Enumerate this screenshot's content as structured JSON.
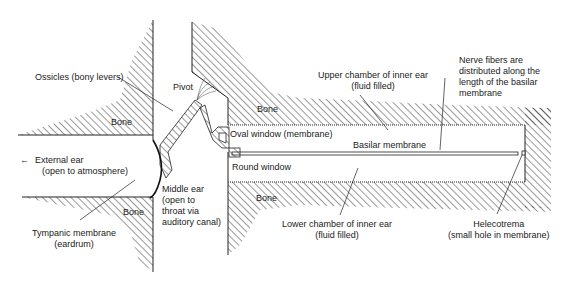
{
  "diagram": {
    "colors": {
      "line": "#222222",
      "hatch": "#333333",
      "background": "#ffffff"
    }
  },
  "labels": {
    "ossicles": "Ossicles (bony levers)",
    "pivot": "Pivot",
    "bone_left": "Bone",
    "bone_upper_right": "Bone",
    "bone_lower_left": "Bone",
    "bone_lower_right": "Bone",
    "oval_window": "Oval window (membrane)",
    "round_window": "Round window",
    "basilar_membrane": "Basilar membrane",
    "upper_chamber_1": "Upper chamber of inner ear",
    "upper_chamber_2": "(fluid filled)",
    "nerve_1": "Nerve fibers are",
    "nerve_2": "distributed along the",
    "nerve_3": "length of the basilar",
    "nerve_4": "membrane",
    "external_ear_1": "External ear",
    "external_ear_2": "(open to atmosphere)",
    "external_arrow": "←",
    "middle_ear_1": "Middle ear",
    "middle_ear_2": "(open to",
    "middle_ear_3": "throat via",
    "middle_ear_4": "auditory canal)",
    "tympanic_1": "Tympanic membrane",
    "tympanic_2": "(eardrum)",
    "lower_chamber_1": "Lower chamber of inner ear",
    "lower_chamber_2": "(fluid filled)",
    "helecotrema_1": "Helecotrema",
    "helecotrema_2": "(small hole in membrane)"
  }
}
